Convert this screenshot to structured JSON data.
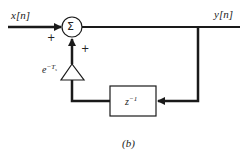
{
  "diagram": {
    "input_label": "x[n]",
    "output_label": "y[n]",
    "summer_symbol": "Σ",
    "plus_left": "+",
    "plus_bottom": "+",
    "gain_label_base": "e",
    "gain_label_exp": "−T",
    "gain_label_sub": "s",
    "delay_label_base": "z",
    "delay_label_exp": "−1",
    "caption": "(b)"
  },
  "colors": {
    "line": "#1a1a1a",
    "background": "#ffffff"
  }
}
